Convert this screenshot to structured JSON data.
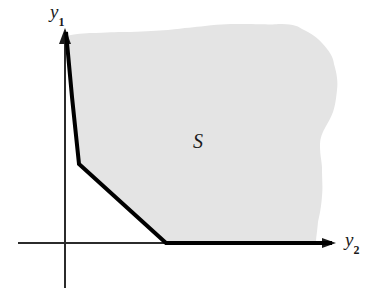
{
  "figure": {
    "title": "",
    "type": "geometric-diagram",
    "background_color": "#ffffff",
    "region": {
      "label": "S",
      "fill_color": "#e4e4e4",
      "label_position": {
        "x": 193,
        "y": 130
      }
    },
    "axes": {
      "vertical": {
        "label_main": "y",
        "label_sub": "1",
        "label_position": {
          "x": 50,
          "y": 4
        },
        "color": "#1a1a1a",
        "origin": {
          "x": 65,
          "y": 243
        },
        "tip": {
          "x": 65,
          "y": 28
        },
        "extends_below_origin_to": 288
      },
      "horizontal": {
        "label_main": "y",
        "label_sub": "2",
        "label_position": {
          "x": 345,
          "y": 230
        },
        "color": "#1a1a1a",
        "origin": {
          "x": 65,
          "y": 243
        },
        "tip": {
          "x": 336,
          "y": 243
        },
        "extends_left_of_origin_to": 18
      }
    },
    "boundary": {
      "description": "thick piecewise-linear efficient frontier",
      "color": "#000000",
      "stroke_width": 4,
      "vertices": [
        {
          "x": 66,
          "y": 32
        },
        {
          "x": 72,
          "y": 97
        },
        {
          "x": 79,
          "y": 164
        },
        {
          "x": 166,
          "y": 243
        },
        {
          "x": 332,
          "y": 243
        }
      ]
    },
    "shaded_outline": {
      "description": "wavy free-form upper and right border of set S",
      "points": [
        {
          "x": 66,
          "y": 36
        },
        {
          "x": 96,
          "y": 33
        },
        {
          "x": 130,
          "y": 32
        },
        {
          "x": 168,
          "y": 30
        },
        {
          "x": 205,
          "y": 26
        },
        {
          "x": 243,
          "y": 24
        },
        {
          "x": 278,
          "y": 24
        },
        {
          "x": 302,
          "y": 29
        },
        {
          "x": 322,
          "y": 43
        },
        {
          "x": 334,
          "y": 64
        },
        {
          "x": 337,
          "y": 90
        },
        {
          "x": 333,
          "y": 112
        },
        {
          "x": 325,
          "y": 128
        },
        {
          "x": 320,
          "y": 146
        },
        {
          "x": 322,
          "y": 168
        },
        {
          "x": 322,
          "y": 196
        },
        {
          "x": 318,
          "y": 222
        },
        {
          "x": 316,
          "y": 243
        }
      ]
    }
  }
}
